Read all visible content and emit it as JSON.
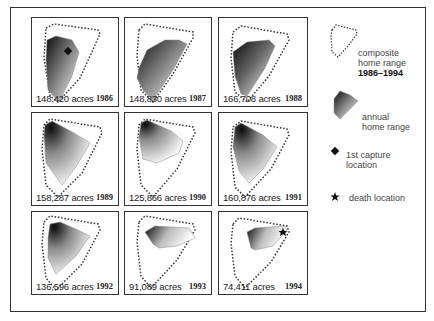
{
  "panels": [
    {
      "acres": "148,420 acres",
      "year": "1986",
      "marker": "capture"
    },
    {
      "acres": "148,830 acres",
      "year": "1987",
      "marker": ""
    },
    {
      "acres": "166,708 acres",
      "year": "1988",
      "marker": ""
    },
    {
      "acres": "158,287 acres",
      "year": "1989",
      "marker": ""
    },
    {
      "acres": "125,866 acres",
      "year": "1990",
      "marker": ""
    },
    {
      "acres": "160,876 acres",
      "year": "1991",
      "marker": ""
    },
    {
      "acres": "136,596 acres",
      "year": "1992",
      "marker": ""
    },
    {
      "acres": "91,089 acres",
      "year": "1993",
      "marker": ""
    },
    {
      "acres": "74,411 acres",
      "year": "1994",
      "marker": "death"
    }
  ],
  "legend": {
    "composite_line1": "composite",
    "composite_line2": "home range",
    "composite_years": "1986–1994",
    "annual_line1": "annual",
    "annual_line2": "home range",
    "capture_line1": "1st capture",
    "capture_line2": "location",
    "death": "death location"
  },
  "colors": {
    "border": "#333333",
    "shade_dark": "#111111",
    "shade_light": "#ffffff",
    "dotted": "#333333"
  }
}
